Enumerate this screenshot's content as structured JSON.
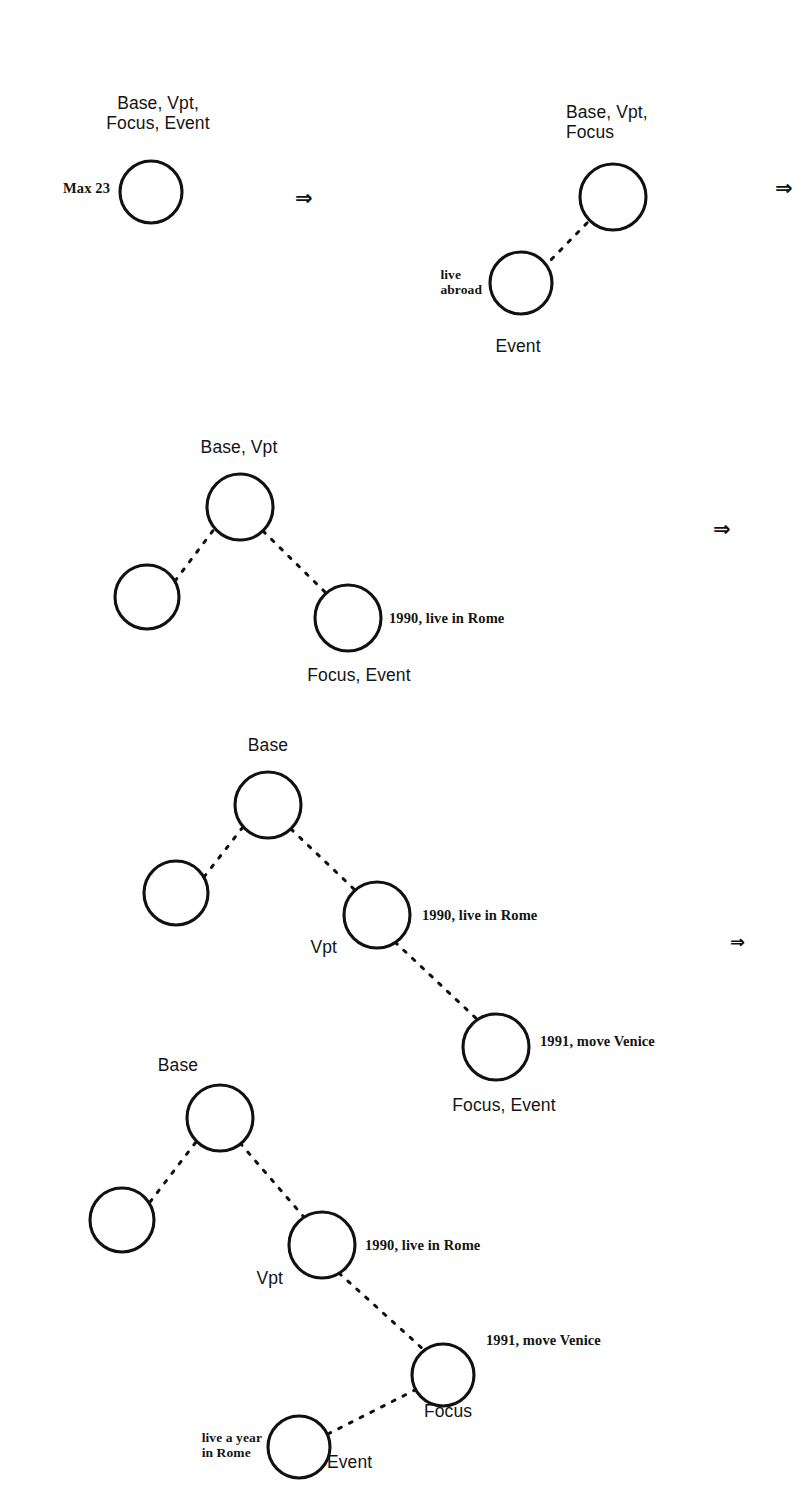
{
  "figure": {
    "caption_tag": "Max 23",
    "node_radius_default": 33,
    "ink_color": "#111111",
    "background_color": "#ffffff",
    "transition_arrow": "⇒"
  },
  "diagrams": [
    {
      "id": "stage-1",
      "name": "initial-single-node",
      "labels": {
        "top": "Base, Vpt,\nFocus, Event",
        "left_annotation": "Max 23"
      },
      "nodes": [
        {
          "name": "root",
          "cx": 151,
          "cy": 192,
          "r": 31,
          "role": "Base, Vpt, Focus, Event"
        }
      ],
      "edges": []
    },
    {
      "id": "stage-2",
      "name": "base-vpt-focus-with-event",
      "labels": {
        "top": "Base, Vpt,\nFocus",
        "bottom": "Event",
        "event_annotation": "live\nabroad"
      },
      "nodes": [
        {
          "name": "base-vpt-focus",
          "cx": 613,
          "cy": 197,
          "r": 33,
          "role": "Base, Vpt, Focus"
        },
        {
          "name": "event",
          "cx": 521,
          "cy": 283,
          "r": 31,
          "role": "Event"
        }
      ],
      "edges": [
        {
          "from": "event",
          "to": "base-vpt-focus"
        }
      ]
    },
    {
      "id": "stage-3",
      "name": "base-vpt-with-focus-event",
      "labels": {
        "top": "Base, Vpt",
        "bottom": "Focus, Event",
        "right_annotation": "1990, live in Rome"
      },
      "nodes": [
        {
          "name": "base-vpt",
          "cx": 240,
          "cy": 507,
          "r": 33,
          "role": "Base, Vpt"
        },
        {
          "name": "past",
          "cx": 147,
          "cy": 597,
          "r": 32,
          "role": ""
        },
        {
          "name": "focus-event",
          "cx": 348,
          "cy": 618,
          "r": 33,
          "role": "Focus, Event"
        }
      ],
      "edges": [
        {
          "from": "past",
          "to": "base-vpt"
        },
        {
          "from": "base-vpt",
          "to": "focus-event"
        }
      ]
    },
    {
      "id": "stage-4",
      "name": "base-vpt-focus-event-chain",
      "labels": {
        "top": "Base",
        "vpt": "Vpt",
        "bottom": "Focus, Event",
        "vpt_annotation": "1990, live in Rome",
        "focus_annotation": "1991, move Venice"
      },
      "nodes": [
        {
          "name": "base",
          "cx": 268,
          "cy": 805,
          "r": 33,
          "role": "Base"
        },
        {
          "name": "past",
          "cx": 176,
          "cy": 893,
          "r": 32,
          "role": ""
        },
        {
          "name": "vpt",
          "cx": 377,
          "cy": 915,
          "r": 33,
          "role": "Vpt"
        },
        {
          "name": "focus-event",
          "cx": 496,
          "cy": 1047,
          "r": 33,
          "role": "Focus, Event"
        }
      ],
      "edges": [
        {
          "from": "past",
          "to": "base"
        },
        {
          "from": "base",
          "to": "vpt"
        },
        {
          "from": "vpt",
          "to": "focus-event"
        }
      ]
    },
    {
      "id": "stage-5",
      "name": "base-vpt-focus-event-full-chain",
      "labels": {
        "top": "Base",
        "vpt": "Vpt",
        "focus": "Focus",
        "event": "Event",
        "vpt_annotation": "1990, live in Rome",
        "focus_annotation": "1991, move Venice",
        "event_annotation": "live a year\nin Rome"
      },
      "nodes": [
        {
          "name": "base",
          "cx": 220,
          "cy": 1118,
          "r": 33,
          "role": "Base"
        },
        {
          "name": "past",
          "cx": 122,
          "cy": 1220,
          "r": 32,
          "role": ""
        },
        {
          "name": "vpt",
          "cx": 322,
          "cy": 1245,
          "r": 33,
          "role": "Vpt"
        },
        {
          "name": "focus",
          "cx": 443,
          "cy": 1375,
          "r": 31,
          "role": "Focus"
        },
        {
          "name": "event",
          "cx": 299,
          "cy": 1447,
          "r": 31,
          "role": "Event"
        }
      ],
      "edges": [
        {
          "from": "past",
          "to": "base"
        },
        {
          "from": "base",
          "to": "vpt"
        },
        {
          "from": "vpt",
          "to": "focus"
        },
        {
          "from": "event",
          "to": "focus"
        }
      ]
    }
  ],
  "arrows": [
    {
      "name": "transition-arrow-1",
      "glyph": "⇒",
      "x": 295,
      "y": 188
    },
    {
      "name": "transition-arrow-2",
      "glyph": "⇒",
      "x": 775,
      "y": 178
    },
    {
      "name": "transition-arrow-3",
      "glyph": "⇒",
      "x": 713,
      "y": 519
    },
    {
      "name": "transition-arrow-4",
      "glyph": "⇒",
      "x": 730,
      "y": 933
    }
  ]
}
